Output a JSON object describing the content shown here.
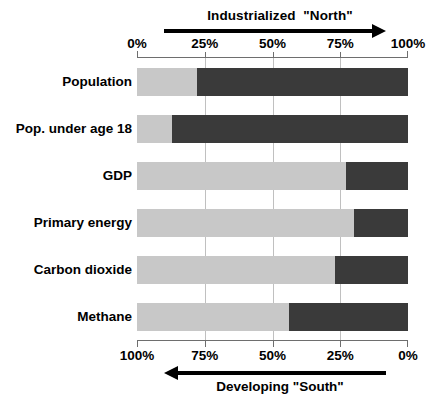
{
  "chart_data": {
    "type": "bar",
    "title": "",
    "orientation": "horizontal",
    "stacked": true,
    "normalized_percent": true,
    "categories": [
      "Population",
      "Pop. under age 18",
      "GDP",
      "Primary energy",
      "Carbon dioxide",
      "Methane"
    ],
    "series": [
      {
        "name": "Developing \"South\"",
        "color": "#c8c8c8",
        "values": [
          22,
          13,
          77,
          80,
          73,
          56
        ]
      },
      {
        "name": "Industrialized \"North\"",
        "color": "#3a3a3a",
        "values": [
          78,
          87,
          23,
          20,
          27,
          44
        ]
      }
    ],
    "top_axis": {
      "label": "Industrialized  \"North\"",
      "direction": "left-to-right",
      "ticks": [
        {
          "value": 0,
          "label": "0%"
        },
        {
          "value": 25,
          "label": "25%"
        },
        {
          "value": 50,
          "label": "50%"
        },
        {
          "value": 75,
          "label": "75%"
        },
        {
          "value": 100,
          "label": "100%"
        }
      ],
      "range": [
        0,
        100
      ]
    },
    "bottom_axis": {
      "label": "Developing \"South\"",
      "direction": "right-to-left",
      "ticks": [
        {
          "value": 100,
          "label": "100%"
        },
        {
          "value": 75,
          "label": "75%"
        },
        {
          "value": 50,
          "label": "50%"
        },
        {
          "value": 25,
          "label": "25%"
        },
        {
          "value": 0,
          "label": "0%"
        }
      ],
      "range": [
        100,
        0
      ]
    },
    "gridlines": [
      25,
      50,
      75
    ],
    "xlabel": "",
    "ylabel": "",
    "legend": "none",
    "colors": {
      "south": "#c8c8c8",
      "north": "#3a3a3a",
      "axis": "#6e6e6e",
      "grid": "#c0c0c0",
      "text": "#000000",
      "background": "#ffffff"
    }
  }
}
